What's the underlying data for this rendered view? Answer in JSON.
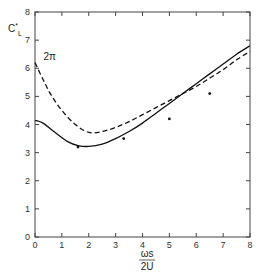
{
  "chart_data": {
    "type": "line",
    "title": "",
    "xlabel_numerator": "ωs",
    "xlabel_denominator": "2U",
    "ylabel": "C*L",
    "xlim": [
      0,
      8
    ],
    "ylim": [
      0,
      8
    ],
    "x_ticks": [
      "0",
      "1",
      "2",
      "3",
      "4",
      "5",
      "6",
      "7",
      "8"
    ],
    "y_ticks": [
      "0",
      "1",
      "2",
      "3",
      "4",
      "5",
      "6",
      "7",
      "8"
    ],
    "grid": false,
    "annotations": [
      {
        "text": "2π",
        "x": 0.2,
        "y": 6.3
      }
    ],
    "series": [
      {
        "name": "solid",
        "style": "solid",
        "x": [
          0,
          0.3,
          0.7,
          1.2,
          1.6,
          2.0,
          2.5,
          3.0,
          3.5,
          4.0,
          4.5,
          5.0,
          5.5,
          6.0,
          6.5,
          7.0,
          7.5,
          8.0
        ],
        "y": [
          4.15,
          4.05,
          3.75,
          3.4,
          3.25,
          3.22,
          3.3,
          3.5,
          3.75,
          4.05,
          4.4,
          4.75,
          5.1,
          5.45,
          5.8,
          6.15,
          6.5,
          6.8
        ]
      },
      {
        "name": "dashed",
        "style": "dashed",
        "x": [
          0,
          0.3,
          0.6,
          1.0,
          1.5,
          2.0,
          2.5,
          3.0,
          3.5,
          4.0,
          4.5,
          5.0,
          5.5,
          6.0,
          6.5,
          7.0,
          7.5,
          8.0
        ],
        "y": [
          6.2,
          5.6,
          5.05,
          4.5,
          4.0,
          3.72,
          3.75,
          3.9,
          4.1,
          4.35,
          4.6,
          4.85,
          5.1,
          5.35,
          5.65,
          5.95,
          6.3,
          6.6
        ]
      },
      {
        "name": "data-points",
        "style": "markers",
        "x": [
          1.6,
          3.3,
          5.0,
          6.5
        ],
        "y": [
          3.2,
          3.5,
          4.2,
          5.1
        ]
      }
    ]
  }
}
